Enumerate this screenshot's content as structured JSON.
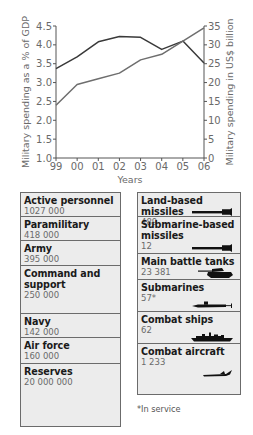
{
  "chart_data": {
    "type": "line",
    "title": "",
    "xlabel": "Years",
    "ylabel": "Military spending as a % of GDP",
    "ylabel_right": "Military spending in US$ billion",
    "categories": [
      "99",
      "00",
      "01",
      "02",
      "03",
      "04",
      "05",
      "06"
    ],
    "ylim": [
      1.0,
      4.5
    ],
    "ylim_right": [
      0,
      35
    ],
    "yticks": [
      "1.0",
      "1.5",
      "2.0",
      "2.5",
      "3.0",
      "3.5",
      "4.0",
      "4.5"
    ],
    "yticks_right": [
      "0",
      "5",
      "10",
      "15",
      "20",
      "25",
      "30",
      "35"
    ],
    "grid": false,
    "legend": null,
    "series": [
      {
        "name": "Military spending as a % of GDP",
        "axis": "left",
        "color": "#3a3a3a",
        "values": [
          3.37,
          3.68,
          4.08,
          4.22,
          4.2,
          3.88,
          4.1,
          3.52
        ]
      },
      {
        "name": "Military spending in US$ billion",
        "axis": "right",
        "color": "#6e6e6e",
        "values": [
          14.0,
          19.5,
          21.0,
          22.5,
          26.0,
          27.5,
          31.0,
          34.5
        ]
      }
    ]
  },
  "personnel": [
    {
      "label": "Active personnel",
      "value": "1027 000"
    },
    {
      "label": "Paramilitary",
      "value": "418 000"
    },
    {
      "label": "Army",
      "value": "395 000"
    },
    {
      "label": "Command and support",
      "value": "250 000"
    },
    {
      "label": "Navy",
      "value": "142 000"
    },
    {
      "label": "Air force",
      "value": "160 000"
    },
    {
      "label": "Reserves",
      "value": "20 000 000"
    }
  ],
  "equipment": [
    {
      "label": "Land-based missiles",
      "value": "489",
      "icon": "missile-icon"
    },
    {
      "label": "Submarine-based missiles",
      "value": "12",
      "icon": "missile-icon"
    },
    {
      "label": "Main battle tanks",
      "value": "23 381",
      "icon": "tank-icon"
    },
    {
      "label": "Submarines",
      "value": "57*",
      "icon": "submarine-icon"
    },
    {
      "label": "Combat ships",
      "value": "62",
      "icon": "ship-icon"
    },
    {
      "label": "Combat aircraft",
      "value": "1 233",
      "icon": "aircraft-icon"
    }
  ],
  "footnote": "*In service"
}
